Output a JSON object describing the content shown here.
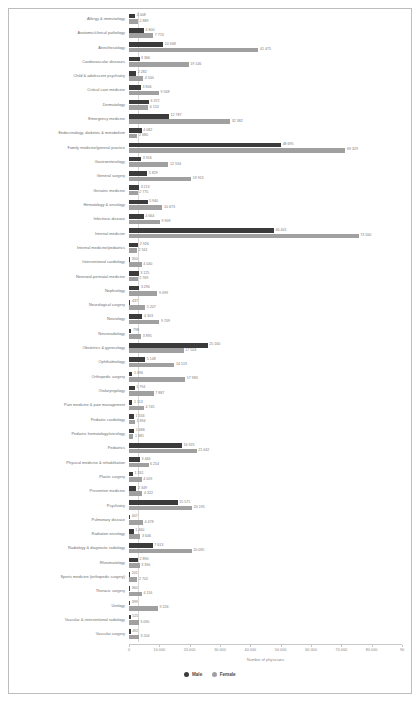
{
  "chart_data": {
    "type": "bar",
    "orientation": "horizontal-grouped",
    "title": "",
    "xlabel": "Number of physicians",
    "ylabel": "",
    "xlim": [
      0,
      90000
    ],
    "xticks": [
      0,
      10000,
      20000,
      30000,
      40000,
      50000,
      60000,
      70000,
      80000,
      90000
    ],
    "xticklabels": [
      "0",
      "10 000",
      "20 000",
      "30 000",
      "40 000",
      "50 000",
      "60 000",
      "70 000",
      "80 000",
      "90"
    ],
    "grid": false,
    "legend_position": "bottom",
    "series": [
      {
        "name": "Male",
        "color": "#3b3b3b",
        "values": [
          2008,
          4800,
          10948,
          3366,
          2282,
          3806,
          6372,
          12787,
          4082,
          48695,
          3916,
          5829,
          3213,
          5940,
          4664,
          46401,
          2926,
          350,
          3125,
          3296,
          437,
          4303,
          798,
          25160,
          5148,
          1096,
          1794,
          1113,
          1556,
          1686,
          16925,
          3466,
          1261,
          2349,
          15571,
          407,
          1460,
          7613,
          2890,
          201,
          360,
          399,
          525,
          492
        ]
      },
      {
        "name": "Female",
        "color": "#a0a0a0",
        "values": [
          2889,
          7774,
          41475,
          19146,
          4500,
          9568,
          6153,
          32382,
          2680,
          69329,
          12594,
          19915,
          2775,
          10673,
          9909,
          73560,
          2561,
          4040,
          2769,
          9099,
          5207,
          9709,
          3895,
          17503,
          14519,
          17983,
          7887,
          4745,
          1894,
          1381,
          21642,
          6254,
          4059,
          4322,
          20195,
          4478,
          3646,
          20095,
          3390,
          2702,
          4116,
          9226,
          3090,
          3204
        ]
      }
    ],
    "categories": [
      "Allergy & immunology",
      "Anatomic/clinical pathology",
      "Anesthesiology",
      "Cardiovascular diseases",
      "Child & adolescent psychiatry",
      "Critical care medicine",
      "Dermatology",
      "Emergency medicine",
      "Endocrinology, diabetes & metabolism",
      "Family medicine/general practice",
      "Gastroenterology",
      "General surgery",
      "Geriatric medicine",
      "Hematology & oncology",
      "Infectious disease",
      "Internal medicine",
      "Internal medicine/pediatrics",
      "Interventional cardiology",
      "Neonatal-perinatal medicine",
      "Nephrology",
      "Neurological surgery",
      "Neurology",
      "Neuroradiology",
      "Obstetrics & gynecology",
      "Ophthalmology",
      "Orthopedic surgery",
      "Otolaryngology",
      "Pain medicine & pain management",
      "Pediatric cardiology",
      "Pediatric hematology/oncology",
      "Pediatrics",
      "Physical medicine & rehabilitation",
      "Plastic surgery",
      "Preventive medicine",
      "Psychiatry",
      "Pulmonary disease",
      "Radiation oncology",
      "Radiology & diagnostic radiology",
      "Rheumatology",
      "Sports medicine (orthopedic surgery)",
      "Thoracic surgery",
      "Urology",
      "Vascular & interventional radiology",
      "Vascular surgery"
    ],
    "value_labels": {
      "Allergy & immunology": [
        "2 008",
        "2 889"
      ],
      "Anatomic/clinical pathology": [
        "4 800",
        "7 774"
      ],
      "Anesthesiology": [
        "10 948",
        "41 475"
      ],
      "Cardiovascular diseases": [
        "3 366",
        "19 146"
      ],
      "Child & adolescent psychiatry": [
        "2 282",
        "4 500"
      ],
      "Critical care medicine": [
        "3 806",
        "9 568"
      ],
      "Dermatology": [
        "6 372",
        "6 153"
      ],
      "Emergency medicine": [
        "12 787",
        "32 382"
      ],
      "Endocrinology, diabetes & metabolism": [
        "4 082",
        "2 680"
      ],
      "Family medicine/general practice": [
        "48 695",
        "69 329"
      ],
      "Gastroenterology": [
        "3 916",
        "12 594"
      ],
      "General surgery": [
        "5 829",
        "19 915"
      ],
      "Geriatric medicine": [
        "3 213",
        "2 775"
      ],
      "Hematology & oncology": [
        "5 940",
        "10 673"
      ],
      "Infectious disease": [
        "4 664",
        "9 909"
      ],
      "Internal medicine": [
        "46 401",
        "73 560"
      ],
      "Internal medicine/pediatrics": [
        "2 926",
        "2 561"
      ],
      "Interventional cardiology": [
        "350",
        "4 040"
      ],
      "Neonatal-perinatal medicine": [
        "3 125",
        "2 769"
      ],
      "Nephrology": [
        "3 296",
        "9 099"
      ],
      "Neurological surgery": [
        "437",
        "5 207"
      ],
      "Neurology": [
        "4 303",
        "9 709"
      ],
      "Neuroradiology": [
        "798",
        "3 895"
      ],
      "Obstetrics & gynecology": [
        "25 160",
        "17 503"
      ],
      "Ophthalmology": [
        "5 148",
        "14 519"
      ],
      "Orthopedic surgery": [
        "1 096",
        "17 983"
      ],
      "Otolaryngology": [
        "1 794",
        "7 887"
      ],
      "Pain medicine & pain management": [
        "1 113",
        "4 745"
      ],
      "Pediatric cardiology": [
        "1 556",
        "1 894"
      ],
      "Pediatric hematology/oncology": [
        "1 686",
        "1 381"
      ],
      "Pediatrics": [
        "16 925",
        "21 642"
      ],
      "Physical medicine & rehabilitation": [
        "3 466",
        "6 254"
      ],
      "Plastic surgery": [
        "1 261",
        "4 059"
      ],
      "Preventive medicine": [
        "2 349",
        "4 322"
      ],
      "Psychiatry": [
        "15 571",
        "20 195"
      ],
      "Pulmonary disease": [
        "407",
        "4 478"
      ],
      "Radiation oncology": [
        "1 460",
        "3 646"
      ],
      "Radiology & diagnostic radiology": [
        "7 613",
        "20 095"
      ],
      "Rheumatology": [
        "2 890",
        "3 390"
      ],
      "Sports medicine (orthopedic surgery)": [
        "201",
        "2 702"
      ],
      "Thoracic surgery": [
        "360",
        "4 116"
      ],
      "Urology": [
        "399",
        "9 226"
      ],
      "Vascular & interventional radiology": [
        "525",
        "3 090"
      ],
      "Vascular surgery": [
        "492",
        "3 204"
      ]
    }
  },
  "legend": {
    "items": [
      {
        "label": "Male",
        "color": "#3b3b3b"
      },
      {
        "label": "Female",
        "color": "#a0a0a0"
      }
    ]
  },
  "axis": {
    "title": "Number of physicians"
  }
}
